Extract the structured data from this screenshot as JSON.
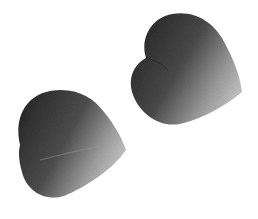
{
  "scene": {
    "description": "Two heart-shaped flower petals on a white background, grayscale",
    "background": "#ffffff",
    "petals": [
      {
        "name": "upper-right-petal",
        "dark": "#2a2a2a",
        "mid": "#6e6e6e",
        "light": "#bdbdbd"
      },
      {
        "name": "lower-left-petal",
        "dark": "#2c2c2c",
        "mid": "#707070",
        "light": "#c2c2c2"
      }
    ]
  }
}
